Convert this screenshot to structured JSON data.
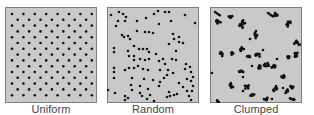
{
  "colors": {
    "panel_fill": "#c9c9c9",
    "panel_border": "#7d7d7d",
    "dot": "#111111",
    "label_text": "#444444"
  },
  "panels": [
    {
      "id": "uniform",
      "label": "Uniform",
      "pattern": "hexagonal grid",
      "grid": {
        "rows": 15,
        "row_spacing": 5.8,
        "col_spacing": 11.4,
        "even_row_cols": 8,
        "odd_row_cols": 7,
        "start_x": 7,
        "start_y": 7
      }
    },
    {
      "id": "random",
      "label": "Random",
      "pattern": "scattered",
      "dots": [
        [
          4,
          8
        ],
        [
          12,
          5
        ],
        [
          16,
          7
        ],
        [
          19,
          10
        ],
        [
          18,
          14
        ],
        [
          11,
          14
        ],
        [
          9,
          19
        ],
        [
          30,
          14
        ],
        [
          39,
          11
        ],
        [
          47,
          7
        ],
        [
          51,
          4
        ],
        [
          58,
          5
        ],
        [
          62,
          5
        ],
        [
          64,
          14
        ],
        [
          78,
          8
        ],
        [
          88,
          16
        ],
        [
          52,
          17
        ],
        [
          15,
          28
        ],
        [
          17,
          30
        ],
        [
          21,
          29
        ],
        [
          23,
          32
        ],
        [
          30,
          24
        ],
        [
          38,
          25
        ],
        [
          42,
          25
        ],
        [
          46,
          26
        ],
        [
          66,
          27
        ],
        [
          72,
          30
        ],
        [
          72,
          35
        ],
        [
          76,
          36
        ],
        [
          67,
          32
        ],
        [
          7,
          41
        ],
        [
          7,
          45
        ],
        [
          27,
          39
        ],
        [
          32,
          42
        ],
        [
          36,
          42
        ],
        [
          40,
          42
        ],
        [
          42,
          45
        ],
        [
          49,
          47
        ],
        [
          62,
          37
        ],
        [
          69,
          44
        ],
        [
          21,
          44
        ],
        [
          22,
          49
        ],
        [
          27,
          49
        ],
        [
          27,
          53
        ],
        [
          33,
          52
        ],
        [
          38,
          53
        ],
        [
          42,
          52
        ],
        [
          52,
          54
        ],
        [
          56,
          52
        ],
        [
          58,
          57
        ],
        [
          65,
          52
        ],
        [
          69,
          53
        ],
        [
          79,
          57
        ],
        [
          83,
          60
        ],
        [
          7,
          61
        ],
        [
          7,
          65
        ],
        [
          18,
          63
        ],
        [
          22,
          61
        ],
        [
          27,
          61
        ],
        [
          31,
          59
        ],
        [
          36,
          62
        ],
        [
          41,
          63
        ],
        [
          53,
          63
        ],
        [
          61,
          63
        ],
        [
          66,
          66
        ],
        [
          78,
          62
        ],
        [
          84,
          65
        ],
        [
          86,
          70
        ],
        [
          7,
          71
        ],
        [
          25,
          71
        ],
        [
          37,
          72
        ],
        [
          46,
          73
        ],
        [
          53,
          75
        ],
        [
          57,
          71
        ],
        [
          60,
          68
        ],
        [
          72,
          76
        ],
        [
          80,
          72
        ],
        [
          84,
          74
        ],
        [
          1,
          83
        ],
        [
          8,
          86
        ],
        [
          24,
          78
        ],
        [
          25,
          83
        ],
        [
          33,
          79
        ],
        [
          33,
          86
        ],
        [
          41,
          82
        ],
        [
          43,
          88
        ],
        [
          52,
          79
        ],
        [
          62,
          85
        ],
        [
          76,
          80
        ],
        [
          80,
          84
        ],
        [
          85,
          84
        ],
        [
          86,
          79
        ],
        [
          18,
          89
        ],
        [
          18,
          93
        ],
        [
          21,
          91
        ],
        [
          35,
          89
        ],
        [
          40,
          92
        ],
        [
          47,
          94
        ],
        [
          60,
          90
        ],
        [
          63,
          89
        ],
        [
          67,
          88
        ],
        [
          70,
          87
        ],
        [
          82,
          89
        ],
        [
          84,
          93
        ]
      ]
    },
    {
      "id": "clumped",
      "label": "Clumped",
      "pattern": "aggregated clusters",
      "clumps": [
        [
          5,
          5,
          3,
          "bar"
        ],
        [
          8,
          14,
          4,
          "cluster"
        ],
        [
          20,
          10,
          3,
          "cluster"
        ],
        [
          31,
          18,
          4,
          "cluster"
        ],
        [
          33,
          15,
          3,
          "cluster"
        ],
        [
          58,
          6,
          3,
          "bar"
        ],
        [
          66,
          8,
          4,
          "cluster"
        ],
        [
          78,
          17,
          4,
          "cluster"
        ],
        [
          46,
          28,
          4,
          "cluster"
        ],
        [
          46,
          24,
          2,
          "dot"
        ],
        [
          40,
          32,
          2,
          "dot"
        ],
        [
          87,
          36,
          4,
          "cluster"
        ],
        [
          12,
          47,
          3,
          "cluster"
        ],
        [
          22,
          46,
          4,
          "cluster"
        ],
        [
          32,
          42,
          3,
          "cluster"
        ],
        [
          38,
          49,
          3,
          "cluster"
        ],
        [
          48,
          48,
          3,
          "cluster"
        ],
        [
          53,
          43,
          2,
          "dot"
        ],
        [
          57,
          59,
          4,
          "cluster"
        ],
        [
          64,
          60,
          3,
          "cluster"
        ],
        [
          67,
          52,
          2,
          "dot"
        ],
        [
          78,
          50,
          3,
          "cluster"
        ],
        [
          86,
          47,
          4,
          "cluster"
        ],
        [
          31,
          64,
          4,
          "cluster"
        ],
        [
          33,
          70,
          2,
          "dot"
        ],
        [
          2,
          66,
          2,
          "dot"
        ],
        [
          21,
          78,
          5,
          "cluster"
        ],
        [
          37,
          80,
          3,
          "cluster"
        ],
        [
          49,
          60,
          3,
          "cluster"
        ],
        [
          73,
          70,
          3,
          "cluster"
        ],
        [
          66,
          82,
          4,
          "cluster"
        ],
        [
          77,
          84,
          3,
          "cluster"
        ],
        [
          82,
          80,
          3,
          "cluster"
        ],
        [
          42,
          88,
          3,
          "cluster"
        ],
        [
          33,
          84,
          2,
          "dot"
        ],
        [
          73,
          81,
          2,
          "dot"
        ],
        [
          56,
          93,
          3,
          "cluster"
        ],
        [
          62,
          92,
          2,
          "dot"
        ],
        [
          8,
          95,
          3,
          "cluster"
        ],
        [
          83,
          92,
          4,
          "cluster"
        ],
        [
          42,
          59,
          2,
          "dot"
        ]
      ]
    }
  ]
}
